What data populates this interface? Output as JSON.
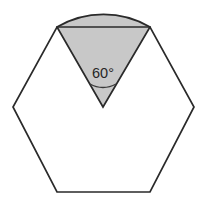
{
  "figure": {
    "name": "regular-hexagon-with-shaded-60-degree-circular-sector",
    "background_color": "#ffffff",
    "width": 207,
    "height": 206,
    "labels": {
      "angle": "60°"
    },
    "colors": {
      "sector_fill": "#c8c8c8",
      "hexagon_fill": "#ffffff",
      "stroke": "#2a2a2a",
      "label_text": "#262626",
      "arc_mark_stroke": "#3a3a3a"
    },
    "stroke_widths": {
      "hexagon": 1.7,
      "sector": 1.7,
      "chord": 1.7,
      "angle_mark": 1.3
    },
    "geometry": {
      "hexagon": {
        "type": "regular-hexagon",
        "orientation": "flat-top",
        "center": [
          103,
          107
        ],
        "circumradius": 92,
        "vertices": [
          [
            57,
            27
          ],
          [
            150,
            27
          ],
          [
            194,
            107
          ],
          [
            150,
            192
          ],
          [
            57,
            192
          ],
          [
            13,
            107
          ]
        ]
      },
      "sector": {
        "type": "circular-sector",
        "apex": [
          103,
          107
        ],
        "radius": 92,
        "central_angle_degrees": 60,
        "start_point": [
          57,
          27
        ],
        "end_point": [
          150,
          27
        ],
        "arc_top_point": [
          103,
          15
        ],
        "bulges_above_top_edge": true
      },
      "chord": {
        "from": [
          57,
          27
        ],
        "to": [
          150,
          27
        ]
      },
      "angle_mark": {
        "type": "arc",
        "center": [
          103,
          107
        ],
        "radius": 26,
        "from": [
          90,
          84
        ],
        "to": [
          116,
          84
        ]
      },
      "angle_label_position": [
        103,
        74
      ]
    }
  }
}
